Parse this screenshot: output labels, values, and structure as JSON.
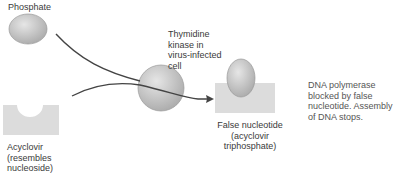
{
  "labels": {
    "phosphate": "Phosphate",
    "acyclovir_l1": "Acyclovir",
    "acyclovir_l2": "(resembles",
    "acyclovir_l3": "nucleoside)",
    "kinase_l1": "Thymidine",
    "kinase_l2": "kinase in",
    "kinase_l3": "virus-infected",
    "kinase_l4": "cell",
    "false_l1": "False nucleotide",
    "false_l2": "(acyclovir triphosphate)",
    "poly_l1": "DNA polymerase",
    "poly_l2": "blocked by false",
    "poly_l3": "nucleotide. Assembly",
    "poly_l4": "of DNA stops."
  },
  "colors": {
    "shape_fill": "#cfcfcf",
    "block_fill": "#dcdcdc",
    "line": "#444444"
  }
}
